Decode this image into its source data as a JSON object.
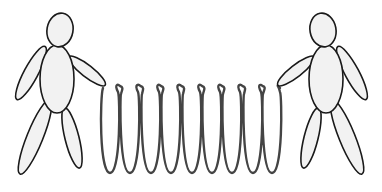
{
  "scene": {
    "description": "Two stick figures holding a stretched coil spring between them",
    "background": "#ffffff",
    "figure_fill": "#f2f2f2",
    "figure_stroke": "#1a1a1a",
    "spring_stroke": "#444444"
  },
  "figures": [
    {
      "name": "left-figure",
      "head": {
        "cx": 60,
        "cy": 30,
        "rx": 13,
        "ry": 17,
        "rot": 10
      },
      "body": {
        "cx": 57,
        "cy": 79,
        "rx": 17,
        "ry": 34
      },
      "arms": [
        {
          "cx": 31,
          "cy": 73,
          "rx": 7,
          "ry": 30,
          "rot": 28
        },
        {
          "cx": 87,
          "cy": 71,
          "rx": 6,
          "ry": 23,
          "rot": -52
        }
      ],
      "legs": [
        {
          "cx": 35,
          "cy": 137,
          "rx": 8,
          "ry": 40,
          "rot": 22
        },
        {
          "cx": 72,
          "cy": 138,
          "rx": 7,
          "ry": 31,
          "rot": -14
        }
      ]
    },
    {
      "name": "right-figure",
      "head": {
        "cx": 323,
        "cy": 30,
        "rx": 13,
        "ry": 17,
        "rot": -10
      },
      "body": {
        "cx": 326,
        "cy": 79,
        "rx": 17,
        "ry": 34
      },
      "arms": [
        {
          "cx": 352,
          "cy": 73,
          "rx": 7,
          "ry": 30,
          "rot": -28
        },
        {
          "cx": 296,
          "cy": 71,
          "rx": 6,
          "ry": 23,
          "rot": 52
        }
      ],
      "legs": [
        {
          "cx": 347,
          "cy": 137,
          "rx": 8,
          "ry": 40,
          "rot": -22
        },
        {
          "cx": 311,
          "cy": 138,
          "rx": 7,
          "ry": 31,
          "rot": 14
        }
      ]
    }
  ],
  "spring": {
    "start_x": 103,
    "end_x": 280,
    "top_y": 86,
    "bottom_y": 173,
    "coil_count": 9,
    "coil_centers_x": [
      110,
      130,
      151,
      171,
      192,
      212,
      232,
      253,
      272
    ]
  }
}
